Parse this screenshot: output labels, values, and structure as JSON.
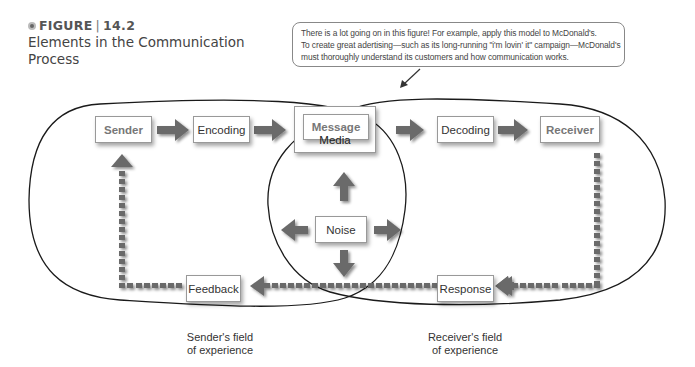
{
  "figure": {
    "label": "FIGURE",
    "number": "14.2",
    "title_line1": "Elements in the Communication",
    "title_line2": "Process"
  },
  "callout": {
    "line1": "There is a lot going on in this figure! For example, apply this model to McDonald's.",
    "line2": "To create great adertising—such as its long-running \"i'm lovin' it\" campaign—McDonald's",
    "line3": "must thoroughly understand its customers and how communication works."
  },
  "nodes": {
    "sender": "Sender",
    "encoding": "Encoding",
    "message": "Message",
    "media": "Media",
    "decoding": "Decoding",
    "receiver": "Receiver",
    "noise": "Noise",
    "feedback": "Feedback",
    "response": "Response"
  },
  "fields": {
    "sender_line1": "Sender's field",
    "sender_line2": "of experience",
    "receiver_line1": "Receiver's field",
    "receiver_line2": "of experience"
  },
  "colors": {
    "arrow": "#6b6b6b",
    "outline": "#1a1a1a",
    "box_border": "#999999",
    "bold_text": "#777777"
  }
}
